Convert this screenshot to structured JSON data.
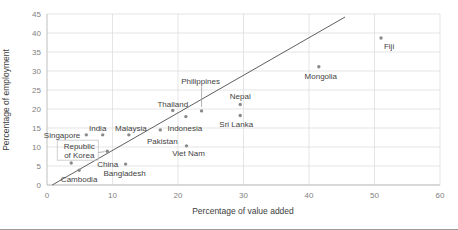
{
  "chart_data": {
    "type": "scatter",
    "title": "",
    "xlabel": "Percentage of value added",
    "ylabel": "Percentage of employment",
    "xlim": [
      0,
      60
    ],
    "ylim": [
      0,
      45
    ],
    "xticks": [
      0,
      10,
      20,
      30,
      40,
      50,
      60
    ],
    "yticks": [
      0,
      5,
      10,
      15,
      20,
      25,
      30,
      35,
      40,
      45
    ],
    "grid": true,
    "legend": "none",
    "identity_line": {
      "x1": 0.8,
      "y1": 0,
      "x2": 45.5,
      "y2": 44.2
    },
    "points": [
      {
        "label": "Cambodia",
        "x": 4.9,
        "y": 3.9,
        "ldx": 0,
        "ldy": 12,
        "anchor": "middle"
      },
      {
        "label": "China",
        "x": 3.7,
        "y": 5.8,
        "ldx": 26,
        "ldy": 4,
        "anchor": "start"
      },
      {
        "label": "Singapore",
        "x": 6,
        "y": 13.2,
        "ldx": -6,
        "ldy": 3,
        "anchor": "end"
      },
      {
        "label": "Republic of Korea",
        "x": 9.2,
        "y": 8.9,
        "ldx": -28,
        "ldy": -2,
        "anchor": "middle",
        "lines": [
          "Republic",
          "of Korea"
        ],
        "box": {
          "x": -50,
          "y": -11,
          "w": 41,
          "h": 20
        },
        "leader": {
          "x1": -9,
          "y1": 1.3,
          "x2": -2.5,
          "y2": 0.5
        }
      },
      {
        "label": "India",
        "x": 8.5,
        "y": 13.2,
        "ldx": -5,
        "ldy": -4,
        "anchor": "middle"
      },
      {
        "label": "Malaysia",
        "x": 12.5,
        "y": 13.2,
        "ldx": 2,
        "ldy": -4,
        "anchor": "middle"
      },
      {
        "label": "Bangladesh",
        "x": 12,
        "y": 5.5,
        "ldx": -1,
        "ldy": 12,
        "anchor": "middle"
      },
      {
        "label": "Pakistan",
        "x": 17.3,
        "y": 14.5,
        "ldx": 2,
        "ldy": 14,
        "anchor": "middle"
      },
      {
        "label": "Thailand",
        "x": 19.2,
        "y": 19.6,
        "ldx": 0,
        "ldy": -4,
        "anchor": "middle"
      },
      {
        "label": "Indonesia",
        "x": 21.2,
        "y": 18,
        "ldx": -1,
        "ldy": 14,
        "anchor": "middle"
      },
      {
        "label": "Viet Nam",
        "x": 21.3,
        "y": 10.3,
        "ldx": 2,
        "ldy": 10,
        "anchor": "middle"
      },
      {
        "label": "Philippines",
        "x": 23.6,
        "y": 19.5,
        "ldx": -1,
        "ldy": -27,
        "anchor": "middle",
        "leader": {
          "x1": 0,
          "y1": -4,
          "x2": 0,
          "y2": -24.5
        }
      },
      {
        "label": "Sri Lanka",
        "x": 29.5,
        "y": 18.3,
        "ldx": -4,
        "ldy": 12,
        "anchor": "middle"
      },
      {
        "label": "Nepal",
        "x": 29.5,
        "y": 21.2,
        "ldx": 0,
        "ldy": -5,
        "anchor": "middle"
      },
      {
        "label": "Mongolia",
        "x": 41.5,
        "y": 31.1,
        "ldx": 2,
        "ldy": 12,
        "anchor": "middle"
      },
      {
        "label": "Fiji",
        "x": 51,
        "y": 38.7,
        "ldx": 8,
        "ldy": 11,
        "anchor": "middle"
      }
    ]
  },
  "colors": {
    "dot": "#8a8a8a",
    "trend_line": "#4d4d4d",
    "gridline": "#dadada",
    "axis": "#bfbfbf",
    "tick_text": "#7f7f7f",
    "label_text": "#3f3f3f"
  }
}
